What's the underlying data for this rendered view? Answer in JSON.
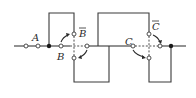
{
  "diagram": {
    "type": "switch-circuit",
    "labels": {
      "a": "A",
      "b": "B",
      "b_bar": "B",
      "c": "C",
      "c_bar": "C"
    },
    "colors": {
      "line": "#3a3a3a",
      "background": "#ffffff"
    }
  }
}
